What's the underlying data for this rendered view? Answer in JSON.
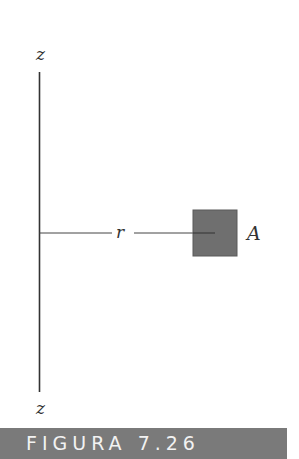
{
  "diagram": {
    "axis_label_top": "z",
    "axis_label_bottom": "z",
    "distance_label": "r",
    "area_label": "A",
    "colors": {
      "line": "#333333",
      "square_fill": "#6f6f6f",
      "caption_bg": "#7a7a7a",
      "caption_text": "#f2f2f2"
    }
  },
  "caption": {
    "text": "FIGURA 7.26"
  }
}
